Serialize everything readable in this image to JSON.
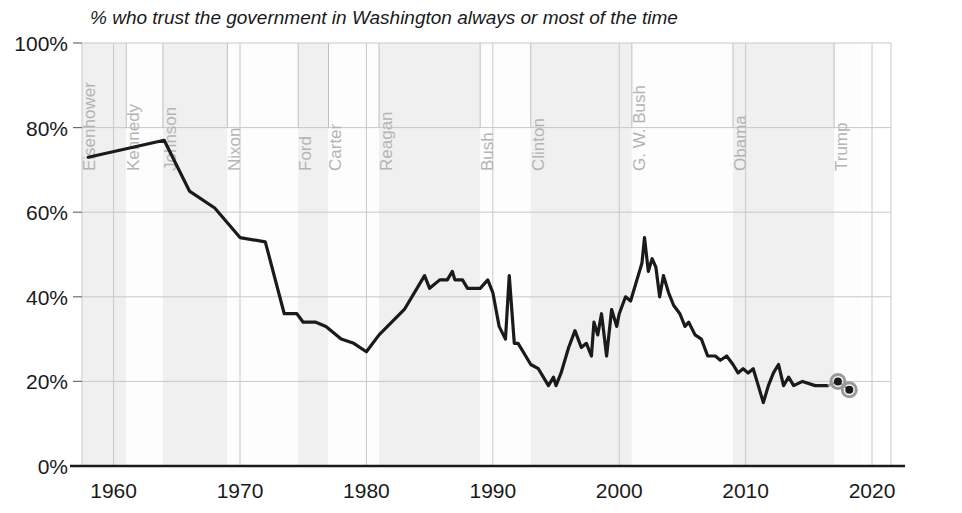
{
  "chart_data": {
    "type": "line",
    "title": "% who trust the government in Washington always or most of the time",
    "xlabel": "",
    "ylabel": "",
    "xlim": [
      1957.5,
      2021.5
    ],
    "ylim": [
      0,
      100
    ],
    "grid": true,
    "legend_position": "none",
    "x_ticks": [
      "1960",
      "1970",
      "1980",
      "1990",
      "2000",
      "2010",
      "2020"
    ],
    "x_tick_values": [
      1960,
      1970,
      1980,
      1990,
      2000,
      2010,
      2020
    ],
    "y_ticks": [
      "0%",
      "20%",
      "40%",
      "60%",
      "80%",
      "100%"
    ],
    "y_tick_values": [
      0,
      20,
      40,
      60,
      80,
      100
    ],
    "series_name": "Trust in government",
    "line_color": "#1a1a1a",
    "band_color": "#f0f0f0",
    "marker_ring_color": "#9a9a9a",
    "eras": [
      {
        "label": "Eisenhower",
        "start": 1957.5,
        "end": 1961.0,
        "shaded": true
      },
      {
        "label": "Kennedy",
        "start": 1961.0,
        "end": 1963.9,
        "shaded": false
      },
      {
        "label": "Johnson",
        "start": 1963.9,
        "end": 1969.0,
        "shaded": true
      },
      {
        "label": "Nixon",
        "start": 1969.0,
        "end": 1974.6,
        "shaded": false
      },
      {
        "label": "Ford",
        "start": 1974.6,
        "end": 1977.0,
        "shaded": true
      },
      {
        "label": "Carter",
        "start": 1977.0,
        "end": 1981.0,
        "shaded": false
      },
      {
        "label": "Reagan",
        "start": 1981.0,
        "end": 1989.0,
        "shaded": true
      },
      {
        "label": "Bush",
        "start": 1989.0,
        "end": 1993.0,
        "shaded": false
      },
      {
        "label": "Clinton",
        "start": 1993.0,
        "end": 2001.0,
        "shaded": true
      },
      {
        "label": "G. W. Bush",
        "start": 2001.0,
        "end": 2009.0,
        "shaded": false
      },
      {
        "label": "Obama",
        "start": 2009.0,
        "end": 2017.0,
        "shaded": true
      },
      {
        "label": "Trump",
        "start": 2017.0,
        "end": 2019.2,
        "shaded": false
      }
    ],
    "points": [
      {
        "x": 1958.0,
        "y": 73
      },
      {
        "x": 1964.0,
        "y": 77
      },
      {
        "x": 1966.0,
        "y": 65
      },
      {
        "x": 1968.0,
        "y": 61
      },
      {
        "x": 1970.0,
        "y": 54
      },
      {
        "x": 1972.0,
        "y": 53
      },
      {
        "x": 1973.5,
        "y": 36
      },
      {
        "x": 1974.5,
        "y": 36
      },
      {
        "x": 1975.0,
        "y": 34
      },
      {
        "x": 1976.0,
        "y": 34
      },
      {
        "x": 1976.8,
        "y": 33
      },
      {
        "x": 1978.0,
        "y": 30
      },
      {
        "x": 1979.0,
        "y": 29
      },
      {
        "x": 1980.0,
        "y": 27
      },
      {
        "x": 1981.0,
        "y": 31
      },
      {
        "x": 1982.0,
        "y": 34
      },
      {
        "x": 1983.0,
        "y": 37
      },
      {
        "x": 1984.0,
        "y": 42
      },
      {
        "x": 1984.6,
        "y": 45
      },
      {
        "x": 1985.0,
        "y": 42
      },
      {
        "x": 1985.8,
        "y": 44
      },
      {
        "x": 1986.4,
        "y": 44
      },
      {
        "x": 1986.8,
        "y": 46
      },
      {
        "x": 1987.0,
        "y": 44
      },
      {
        "x": 1987.6,
        "y": 44
      },
      {
        "x": 1988.0,
        "y": 42
      },
      {
        "x": 1989.0,
        "y": 42
      },
      {
        "x": 1989.6,
        "y": 44
      },
      {
        "x": 1990.0,
        "y": 41
      },
      {
        "x": 1990.5,
        "y": 33
      },
      {
        "x": 1991.0,
        "y": 30
      },
      {
        "x": 1991.3,
        "y": 45
      },
      {
        "x": 1991.7,
        "y": 29
      },
      {
        "x": 1992.0,
        "y": 29
      },
      {
        "x": 1992.6,
        "y": 26
      },
      {
        "x": 1993.0,
        "y": 24
      },
      {
        "x": 1993.6,
        "y": 23
      },
      {
        "x": 1994.0,
        "y": 21
      },
      {
        "x": 1994.4,
        "y": 19
      },
      {
        "x": 1994.8,
        "y": 21
      },
      {
        "x": 1995.0,
        "y": 19
      },
      {
        "x": 1995.4,
        "y": 22
      },
      {
        "x": 1996.0,
        "y": 28
      },
      {
        "x": 1996.5,
        "y": 32
      },
      {
        "x": 1997.0,
        "y": 28
      },
      {
        "x": 1997.4,
        "y": 29
      },
      {
        "x": 1997.8,
        "y": 26
      },
      {
        "x": 1998.0,
        "y": 34
      },
      {
        "x": 1998.3,
        "y": 31
      },
      {
        "x": 1998.6,
        "y": 36
      },
      {
        "x": 1999.0,
        "y": 26
      },
      {
        "x": 1999.4,
        "y": 37
      },
      {
        "x": 1999.8,
        "y": 33
      },
      {
        "x": 2000.0,
        "y": 36
      },
      {
        "x": 2000.5,
        "y": 40
      },
      {
        "x": 2000.9,
        "y": 39
      },
      {
        "x": 2001.3,
        "y": 43
      },
      {
        "x": 2001.8,
        "y": 48
      },
      {
        "x": 2002.0,
        "y": 54
      },
      {
        "x": 2002.3,
        "y": 46
      },
      {
        "x": 2002.6,
        "y": 49
      },
      {
        "x": 2002.9,
        "y": 47
      },
      {
        "x": 2003.2,
        "y": 40
      },
      {
        "x": 2003.5,
        "y": 45
      },
      {
        "x": 2003.9,
        "y": 41
      },
      {
        "x": 2004.3,
        "y": 38
      },
      {
        "x": 2004.8,
        "y": 36
      },
      {
        "x": 2005.2,
        "y": 33
      },
      {
        "x": 2005.5,
        "y": 34
      },
      {
        "x": 2006.0,
        "y": 31
      },
      {
        "x": 2006.5,
        "y": 30
      },
      {
        "x": 2007.0,
        "y": 26
      },
      {
        "x": 2007.6,
        "y": 26
      },
      {
        "x": 2008.0,
        "y": 25
      },
      {
        "x": 2008.5,
        "y": 26
      },
      {
        "x": 2009.0,
        "y": 24
      },
      {
        "x": 2009.4,
        "y": 22
      },
      {
        "x": 2009.8,
        "y": 23
      },
      {
        "x": 2010.2,
        "y": 22
      },
      {
        "x": 2010.6,
        "y": 23
      },
      {
        "x": 2011.0,
        "y": 19
      },
      {
        "x": 2011.4,
        "y": 15
      },
      {
        "x": 2011.8,
        "y": 19
      },
      {
        "x": 2012.2,
        "y": 22
      },
      {
        "x": 2012.6,
        "y": 24
      },
      {
        "x": 2013.0,
        "y": 19
      },
      {
        "x": 2013.4,
        "y": 21
      },
      {
        "x": 2013.8,
        "y": 19
      },
      {
        "x": 2014.5,
        "y": 20
      },
      {
        "x": 2015.5,
        "y": 19
      },
      {
        "x": 2016.5,
        "y": 19
      }
    ],
    "end_markers": [
      {
        "x": 2017.3,
        "y": 20
      },
      {
        "x": 2018.2,
        "y": 18
      }
    ]
  }
}
